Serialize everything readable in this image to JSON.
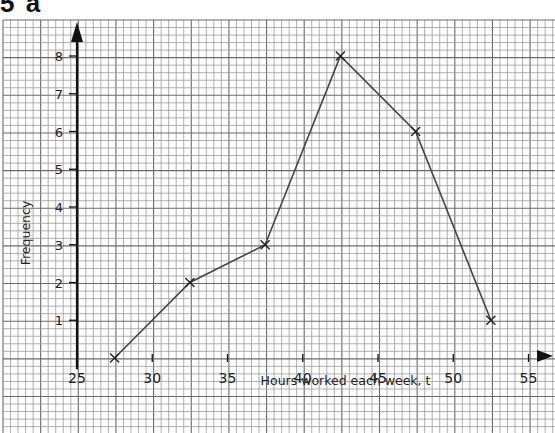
{
  "question": {
    "number": "5",
    "part": "a"
  },
  "chart_data": {
    "type": "line",
    "title": "",
    "xlabel": "Hours worked each week, t",
    "ylabel": "Frequency",
    "x": [
      27.5,
      32.5,
      37.5,
      42.5,
      47.5,
      52.5
    ],
    "values": [
      0,
      2,
      3,
      8,
      6,
      1
    ],
    "series": [
      {
        "name": "Frequency polygon",
        "marker": "x",
        "x": [
          27.5,
          32.5,
          37.5,
          42.5,
          47.5,
          52.5
        ],
        "values": [
          0,
          2,
          3,
          8,
          6,
          1
        ]
      }
    ],
    "xticks": [
      "25",
      "30",
      "35",
      "40",
      "45",
      "50",
      "55"
    ],
    "yticks": [
      "1",
      "2",
      "3",
      "4",
      "5",
      "6",
      "7",
      "8"
    ],
    "xlim": [
      25,
      56
    ],
    "ylim": [
      0,
      8.8
    ],
    "grid": true,
    "legend": null
  },
  "colors": {
    "grid_minor": "#9a9a9a",
    "grid_major": "#6a6a6a",
    "line": "#444444",
    "axis": "#111111"
  }
}
